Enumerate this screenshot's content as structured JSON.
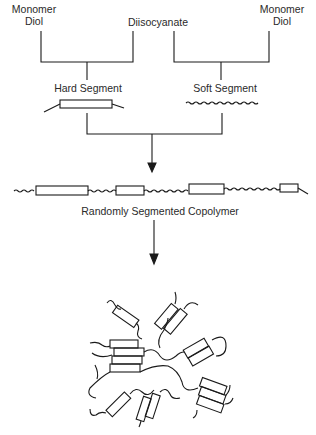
{
  "labels": {
    "monomer_diol_left": [
      "Monomer",
      "Diol"
    ],
    "diisocyanate": "Diisocyanate",
    "monomer_diol_right": [
      "Monomer",
      "Diol"
    ],
    "hard_segment": "Hard Segment",
    "soft_segment": "Soft Segment",
    "copolymer": "Randomly Segmented Copolymer"
  },
  "colors": {
    "stroke": "#1a1a1a",
    "background": "#ffffff"
  }
}
